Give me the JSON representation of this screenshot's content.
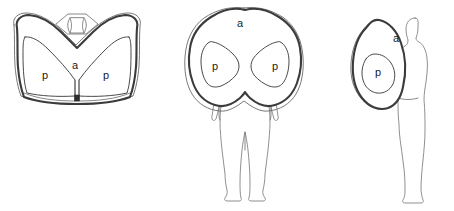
{
  "figure": {
    "background_color": "#ffffff",
    "line_color": "#3b3b3b",
    "label_color": "#1a1a1a",
    "width": 454,
    "height": 211
  },
  "legend_keys": {
    "anterior": "a",
    "posterior": "p"
  },
  "panels": [
    {
      "id": "axial",
      "name": "axial-cross-section-view",
      "labels": [
        {
          "text": "a",
          "x": 75,
          "y": 66,
          "region": "anterior"
        },
        {
          "text": "p",
          "x": 45,
          "y": 76,
          "region": "posterior-left"
        },
        {
          "text": "p",
          "x": 106,
          "y": 76,
          "region": "posterior-right"
        }
      ],
      "has_human_figure": false,
      "inner_structures": 3
    },
    {
      "id": "coronal",
      "name": "coronal-frontal-view",
      "labels": [
        {
          "text": "a",
          "x": 240,
          "y": 24,
          "region": "anterior"
        },
        {
          "text": "p",
          "x": 215,
          "y": 67,
          "region": "posterior-left"
        },
        {
          "text": "p",
          "x": 291,
          "y": 67,
          "region": "posterior-right"
        }
      ],
      "has_human_figure": true,
      "human_figure_orientation": "front-facing",
      "inner_structures": 2
    },
    {
      "id": "sagittal",
      "name": "sagittal-lateral-view",
      "labels": [
        {
          "text": "a",
          "x": 396,
          "y": 39,
          "region": "anterior"
        },
        {
          "text": "p",
          "x": 384,
          "y": 72,
          "region": "posterior"
        }
      ],
      "has_human_figure": true,
      "human_figure_orientation": "side-profile-facing-left",
      "inner_structures": 1
    }
  ]
}
